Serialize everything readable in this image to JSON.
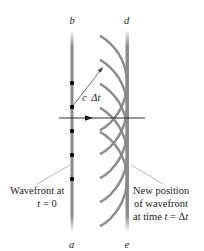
{
  "diagram": {
    "colors": {
      "wavefront": "#8a8a8a",
      "wavelet": "#8a8a8a",
      "ray": "#1a1a1a",
      "dot": "#000000",
      "leader": "#9a9a9a",
      "text": "#222222"
    },
    "labels": {
      "b": "b",
      "a": "a",
      "d": "d",
      "e": "e",
      "c_dt_c": "c",
      "c_dt_dt": "Δt"
    },
    "captions": {
      "left_line1": "Wavefront at",
      "left_line2_var": "t",
      "left_line2_rest": " = 0",
      "right_line1": "New position",
      "right_line2": "of wavefront",
      "right_line3_pre": "at time ",
      "right_line3_var": "t",
      "right_line3_eq": " = Δ",
      "right_line3_var2": "t"
    },
    "geometry": {
      "initial_wavefront_x": 72,
      "new_wavefront_x": 127,
      "wavefront_top_y": 30,
      "wavefront_bottom_y": 232,
      "source_points_y": [
        83,
        107,
        131,
        155,
        179
      ],
      "wavelet_radius": 55,
      "ray_y": 118,
      "ray_x_start": 59,
      "ray_x_end": 145,
      "arrowhead_x": 90
    }
  }
}
